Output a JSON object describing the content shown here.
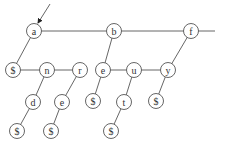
{
  "diagram": {
    "type": "trie (first-child / next-sibling representation)",
    "entry_arrow": {
      "from": [
        50,
        4
      ],
      "to": [
        38,
        23
      ]
    },
    "nodes": [
      {
        "id": "a",
        "label": "a",
        "x": 34,
        "y": 31
      },
      {
        "id": "b",
        "label": "b",
        "x": 114,
        "y": 31
      },
      {
        "id": "f",
        "label": "f",
        "x": 191,
        "y": 31
      },
      {
        "id": "s1",
        "label": "$",
        "x": 13,
        "y": 70
      },
      {
        "id": "n",
        "label": "n",
        "x": 47,
        "y": 70
      },
      {
        "id": "r",
        "label": "r",
        "x": 80,
        "y": 70
      },
      {
        "id": "e1",
        "label": "e",
        "x": 103,
        "y": 70
      },
      {
        "id": "u",
        "label": "u",
        "x": 134,
        "y": 70
      },
      {
        "id": "y",
        "label": "y",
        "x": 168,
        "y": 70
      },
      {
        "id": "d",
        "label": "d",
        "x": 33,
        "y": 102
      },
      {
        "id": "e2",
        "label": "e",
        "x": 62,
        "y": 102
      },
      {
        "id": "s2",
        "label": "$",
        "x": 93,
        "y": 101
      },
      {
        "id": "t",
        "label": "t",
        "x": 124,
        "y": 102
      },
      {
        "id": "s3",
        "label": "$",
        "x": 156,
        "y": 101
      },
      {
        "id": "s4",
        "label": "$",
        "x": 17,
        "y": 131
      },
      {
        "id": "s5",
        "label": "$",
        "x": 51,
        "y": 131
      },
      {
        "id": "s6",
        "label": "$",
        "x": 111,
        "y": 131
      }
    ],
    "sibling_edges": [
      [
        "a",
        "b"
      ],
      [
        "b",
        "f"
      ],
      [
        "s1",
        "n"
      ],
      [
        "n",
        "r"
      ],
      [
        "e1",
        "u"
      ],
      [
        "u",
        "y"
      ]
    ],
    "child_edges": [
      [
        "a",
        "s1"
      ],
      [
        "b",
        "e1"
      ],
      [
        "f",
        "y"
      ],
      [
        "n",
        "d"
      ],
      [
        "r",
        "e2"
      ],
      [
        "e1",
        "s2"
      ],
      [
        "u",
        "t"
      ],
      [
        "y",
        "s3"
      ],
      [
        "d",
        "s4"
      ],
      [
        "e2",
        "s5"
      ],
      [
        "t",
        "s6"
      ]
    ],
    "trailing_line": {
      "from": "f",
      "to_x": 215
    }
  }
}
